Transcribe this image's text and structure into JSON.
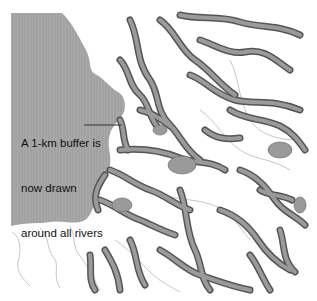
{
  "map": {
    "annotation": {
      "lines": [
        "A 1-km buffer is",
        "now drawn",
        "around all rivers"
      ]
    },
    "colors": {
      "sea": "#a9a9a9",
      "land": "#ffffff",
      "buffer_fill": "#8c8c8c",
      "buffer_outline": "#555555",
      "boundary": "#b8b8b8",
      "urban": "#9a9a9a"
    },
    "layers": [
      "sea",
      "river-buffers-1km",
      "admin-boundaries",
      "urban-areas",
      "annotation-leader"
    ]
  }
}
